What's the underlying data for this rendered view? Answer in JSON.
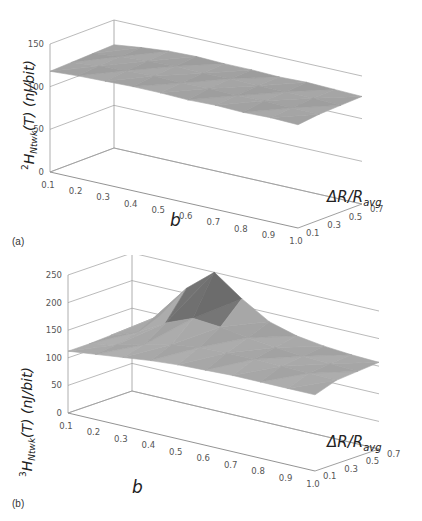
{
  "chart_data": [
    {
      "id": "a",
      "type": "surface3d",
      "panel_label": "(a)",
      "title": "",
      "ylabel": {
        "pre": "2",
        "main": "H",
        "sub": "Ntwk",
        "post": "(T) (nJ/bit)"
      },
      "xlabel": "b",
      "zlabel": {
        "main": "ΔR/R",
        "sub": "avg"
      },
      "x_ticks": [
        "0.1",
        "0.2",
        "0.3",
        "0.4",
        "0.5",
        "0.6",
        "0.7",
        "0.8",
        "0.9",
        "1.0"
      ],
      "z_ticks": [
        "0.1",
        "0.3",
        "0.5",
        "0.7"
      ],
      "y_ticks": [
        "0",
        "50",
        "100",
        "150"
      ],
      "ylim": [
        0,
        150
      ],
      "grid": true,
      "x": [
        0.1,
        0.2,
        0.3,
        0.4,
        0.5,
        0.6,
        0.7,
        0.8,
        0.9,
        1.0
      ],
      "z": [
        0.1,
        0.3,
        0.5,
        0.7
      ],
      "values": [
        [
          118,
          120,
          121,
          122,
          122,
          121,
          122,
          121,
          122,
          121
        ],
        [
          119,
          122,
          124,
          125,
          124,
          125,
          124,
          125,
          124,
          124
        ],
        [
          120,
          124,
          126,
          127,
          126,
          127,
          126,
          126,
          126,
          125
        ],
        [
          121,
          125,
          128,
          129,
          128,
          128,
          127,
          128,
          127,
          126
        ]
      ]
    },
    {
      "id": "b",
      "type": "surface3d",
      "panel_label": "(b)",
      "title": "",
      "ylabel": {
        "pre": "3",
        "main": "H",
        "sub": "Ntwk",
        "post": "(T) (nJ/bit)"
      },
      "xlabel": "b",
      "zlabel": {
        "main": "ΔR/R",
        "sub": "avg"
      },
      "x_ticks": [
        "0.1",
        "0.2",
        "0.3",
        "0.4",
        "0.5",
        "0.6",
        "0.7",
        "0.8",
        "0.9",
        "1.0"
      ],
      "z_ticks": [
        "0.1",
        "0.3",
        "0.5",
        "0.7"
      ],
      "y_ticks": [
        "0",
        "50",
        "100",
        "150",
        "200",
        "250"
      ],
      "ylim": [
        0,
        250
      ],
      "grid": true,
      "x": [
        0.1,
        0.2,
        0.3,
        0.4,
        0.5,
        0.6,
        0.7,
        0.8,
        0.9,
        1.0
      ],
      "z": [
        0.1,
        0.3,
        0.5,
        0.7
      ],
      "values": [
        [
          112,
          118,
          124,
          130,
          134,
          136,
          138,
          138,
          138,
          138
        ],
        [
          112,
          122,
          134,
          146,
          152,
          154,
          154,
          153,
          152,
          151
        ],
        [
          114,
          132,
          160,
          180,
          176,
          168,
          162,
          158,
          156,
          154
        ],
        [
          116,
          148,
          210,
          250,
          214,
          184,
          170,
          163,
          159,
          157
        ]
      ]
    }
  ]
}
